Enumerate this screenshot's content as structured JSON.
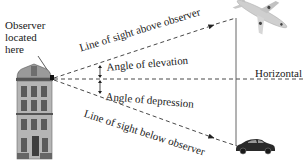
{
  "figure": {
    "observer_label": [
      "Observer",
      "located",
      "here"
    ],
    "line_above_label": "Line of sight above observer",
    "line_below_label": "Line of sight below observer",
    "angle_elevation_label": "Angle of elevation",
    "angle_depression_label": "Angle of depression",
    "horizontal_label": "Horizontal",
    "objects": {
      "building": "building-icon",
      "airplane": "airplane-icon",
      "car": "car-icon"
    },
    "colors": {
      "line": "#333333",
      "text": "#1a1a1a",
      "building": "#8a8a8a",
      "airplane": "#c8c8c8",
      "car": "#2a2a2a"
    }
  }
}
